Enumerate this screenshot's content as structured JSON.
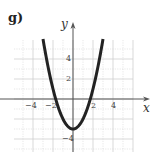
{
  "panel_label": "g)",
  "axes": {
    "x_label": "x",
    "y_label": "y"
  },
  "ticks": {
    "x": [
      {
        "value": -4,
        "label": "−4"
      },
      {
        "value": -2,
        "label": "−2"
      },
      {
        "value": 2,
        "label": "2"
      },
      {
        "value": 4,
        "label": "4"
      }
    ],
    "y": [
      {
        "value": 4,
        "label": "4"
      },
      {
        "value": 2,
        "label": "2"
      },
      {
        "value": -4,
        "label": "−4"
      }
    ]
  },
  "colors": {
    "curve": "#222222",
    "grid": "#d9d9d9",
    "axis": "#555555"
  },
  "chart_data": {
    "type": "line",
    "title": "g)",
    "xlabel": "x",
    "ylabel": "y",
    "function": "y = x^2 - 3",
    "x": [
      -3,
      -2.5,
      -2,
      -1.5,
      -1,
      -0.5,
      0,
      0.5,
      1,
      1.5,
      2,
      2.5,
      3
    ],
    "y": [
      6,
      3.25,
      1,
      -0.75,
      -2,
      -2.75,
      -3,
      -2.75,
      -2,
      -0.75,
      1,
      3.25,
      6
    ],
    "xlim": [
      -6,
      6
    ],
    "ylim": [
      -5,
      6
    ],
    "x_ticks": [
      -4,
      -2,
      2,
      4
    ],
    "y_ticks": [
      -4,
      2,
      4
    ],
    "grid": true,
    "grid_step": 1,
    "vertex": [
      0,
      -3
    ],
    "x_intercepts": [
      -1.73,
      1.73
    ]
  }
}
